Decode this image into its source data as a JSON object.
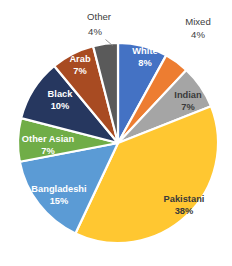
{
  "chart_data": {
    "type": "pie",
    "title": "",
    "subtitle": "",
    "xlabel": "",
    "ylabel": "",
    "legend_position": "none",
    "grid": false,
    "value_unit": "%",
    "total": 100,
    "categories": [
      "White",
      "Mixed",
      "Indian",
      "Pakistani",
      "Bangladeshi",
      "Other Asian",
      "Black",
      "Arab",
      "Other"
    ],
    "values": [
      8,
      4,
      7,
      38,
      15,
      7,
      10,
      7,
      4
    ],
    "colors": [
      "#4472C4",
      "#ED7D31",
      "#A5A5A5",
      "#FFC731",
      "#5B9BD5",
      "#70AD47",
      "#26375F",
      "#A84B22",
      "#5A5A5A"
    ],
    "start_angle_deg": 0,
    "direction": "clockwise",
    "slices": [
      {
        "label": "White",
        "value": 8,
        "value_text": "8%",
        "color": "#4472C4",
        "label_placement": "inside",
        "label_color": "#ffffff"
      },
      {
        "label": "Mixed",
        "value": 4,
        "value_text": "4%",
        "color": "#ED7D31",
        "label_placement": "outside",
        "label_color": "#404040"
      },
      {
        "label": "Indian",
        "value": 7,
        "value_text": "7%",
        "color": "#A5A5A5",
        "label_placement": "inside",
        "label_color": "#3a3a3a"
      },
      {
        "label": "Pakistani",
        "value": 38,
        "value_text": "38%",
        "color": "#FFC731",
        "label_placement": "inside",
        "label_color": "#3a3a3a"
      },
      {
        "label": "Bangladeshi",
        "value": 15,
        "value_text": "15%",
        "color": "#5B9BD5",
        "label_placement": "inside",
        "label_color": "#ffffff"
      },
      {
        "label": "Other Asian",
        "value": 7,
        "value_text": "7%",
        "color": "#70AD47",
        "label_placement": "inside",
        "label_color": "#ffffff"
      },
      {
        "label": "Black",
        "value": 10,
        "value_text": "10%",
        "color": "#26375F",
        "label_placement": "inside",
        "label_color": "#ffffff"
      },
      {
        "label": "Arab",
        "value": 7,
        "value_text": "7%",
        "color": "#A84B22",
        "label_placement": "inside",
        "label_color": "#ffffff"
      },
      {
        "label": "Other",
        "value": 4,
        "value_text": "4%",
        "color": "#5A5A5A",
        "label_placement": "outside",
        "label_color": "#404040"
      }
    ]
  },
  "labels": {
    "white_name": "White",
    "white_pct": "8%",
    "mixed_name": "Mixed",
    "mixed_pct": "4%",
    "indian_name": "Indian",
    "indian_pct": "7%",
    "pakistani_name": "Pakistani",
    "pakistani_pct": "38%",
    "bangladeshi_name": "Bangladeshi",
    "bangladeshi_pct": "15%",
    "other_asian_name": "Other Asian",
    "other_asian_pct": "7%",
    "black_name": "Black",
    "black_pct": "10%",
    "arab_name": "Arab",
    "arab_pct": "7%",
    "other_name": "Other",
    "other_pct": "4%"
  }
}
